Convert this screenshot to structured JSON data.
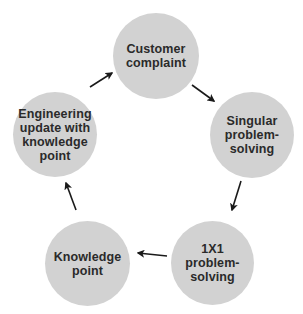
{
  "diagram": {
    "type": "cycle",
    "colors": {
      "node_fill": "#d2d2d2",
      "text": "#2a2a2a",
      "arrow": "#1a1a1a",
      "background": "#ffffff"
    },
    "nodes": [
      {
        "id": "customer-complaint",
        "label": "Customer\ncomplaint"
      },
      {
        "id": "singular-problem-solving",
        "label": "Singular\nproblem-\nsolving"
      },
      {
        "id": "1x1-problem-solving",
        "label": "1X1\nproblem-\nsolving"
      },
      {
        "id": "knowledge-point",
        "label": "Knowledge\npoint"
      },
      {
        "id": "engineering-update",
        "label": "Engineering\nupdate with\nknowledge\npoint"
      }
    ],
    "edges": [
      {
        "from": "customer-complaint",
        "to": "singular-problem-solving"
      },
      {
        "from": "singular-problem-solving",
        "to": "1x1-problem-solving"
      },
      {
        "from": "1x1-problem-solving",
        "to": "knowledge-point"
      },
      {
        "from": "knowledge-point",
        "to": "engineering-update"
      },
      {
        "from": "engineering-update",
        "to": "customer-complaint"
      }
    ]
  }
}
